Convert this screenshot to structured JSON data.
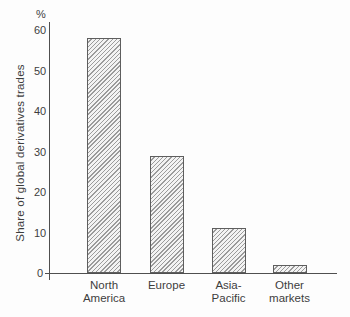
{
  "chart_data": {
    "type": "bar",
    "categories": [
      "North America",
      "Europe",
      "Asia-Pacific",
      "Other markets"
    ],
    "category_label_lines": [
      [
        "North",
        "America"
      ],
      [
        "Europe"
      ],
      [
        "Asia-",
        "Pacific"
      ],
      [
        "Other",
        "markets"
      ]
    ],
    "values": [
      58,
      29,
      11,
      2
    ],
    "title": "",
    "xlabel": "",
    "ylabel": "Share of global derivatives trades",
    "y_unit_label": "%",
    "ylim": [
      0,
      60
    ],
    "yticks": [
      0,
      10,
      20,
      30,
      40,
      50,
      60
    ],
    "grid": false,
    "legend": "none",
    "bar_style": "diagonal-hatch"
  },
  "colors": {
    "background": "#fdfdfd",
    "axis": "#4f4f4f",
    "text": "#3d3d3d",
    "bar_border": "#5e5e5e",
    "bar_hatch_line": "#9b9b9b",
    "bar_fill": "#f3f3f3"
  }
}
